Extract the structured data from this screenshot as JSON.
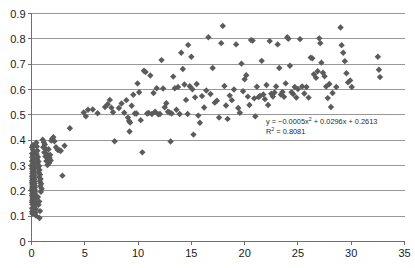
{
  "chart_data": {
    "type": "scatter",
    "title": "",
    "xlabel": "",
    "ylabel": "",
    "xlim": [
      0,
      35
    ],
    "ylim": [
      0,
      0.9
    ],
    "grid": true,
    "grid_axis": "y",
    "legend": false,
    "marker": {
      "shape": "diamond",
      "color": "#5b5b5b",
      "size": 3.2
    },
    "xticks": [
      "0",
      "5",
      "10",
      "15",
      "20",
      "25",
      "30",
      "35"
    ],
    "xtick_values": [
      0,
      5,
      10,
      15,
      20,
      25,
      30,
      35
    ],
    "yticks": [
      "0",
      "0.1",
      "0.2",
      "0.3",
      "0.4",
      "0.5",
      "0.6",
      "0.7",
      "0.8",
      "0.9"
    ],
    "ytick_values": [
      0,
      0.1,
      0.2,
      0.3,
      0.4,
      0.5,
      0.6,
      0.7,
      0.8,
      0.9
    ],
    "annotations": {
      "equation": "y = −0.0005x² + 0.0296x + 0.2613",
      "equation_parts": {
        "lead": "y = −0.0005x",
        "sup": "2",
        "tail": " + 0.0296x + 0.2613"
      },
      "r_squared": "R² = 0.8081",
      "r_squared_parts": {
        "lead": "R",
        "sup": "2",
        "tail": " = 0.8081"
      }
    },
    "fit": {
      "model": "quadratic",
      "a": -0.0005,
      "b": 0.0296,
      "c": 0.2613,
      "r2": 0.8081,
      "drawn": false
    },
    "points": [
      [
        0.05,
        0.372
      ],
      [
        0.06,
        0.347
      ],
      [
        0.07,
        0.333
      ],
      [
        0.05,
        0.318
      ],
      [
        0.08,
        0.305
      ],
      [
        0.06,
        0.296
      ],
      [
        0.05,
        0.287
      ],
      [
        0.09,
        0.276
      ],
      [
        0.07,
        0.268
      ],
      [
        0.05,
        0.258
      ],
      [
        0.08,
        0.249
      ],
      [
        0.06,
        0.241
      ],
      [
        0.05,
        0.232
      ],
      [
        0.09,
        0.224
      ],
      [
        0.07,
        0.215
      ],
      [
        0.05,
        0.206
      ],
      [
        0.08,
        0.198
      ],
      [
        0.06,
        0.189
      ],
      [
        0.05,
        0.181
      ],
      [
        0.1,
        0.172
      ],
      [
        0.07,
        0.163
      ],
      [
        0.05,
        0.155
      ],
      [
        0.09,
        0.146
      ],
      [
        0.06,
        0.131
      ],
      [
        0.05,
        0.118
      ],
      [
        0.08,
        0.11
      ],
      [
        0.12,
        0.38
      ],
      [
        0.14,
        0.362
      ],
      [
        0.16,
        0.352
      ],
      [
        0.13,
        0.341
      ],
      [
        0.18,
        0.33
      ],
      [
        0.15,
        0.322
      ],
      [
        0.2,
        0.312
      ],
      [
        0.17,
        0.303
      ],
      [
        0.22,
        0.294
      ],
      [
        0.19,
        0.286
      ],
      [
        0.24,
        0.278
      ],
      [
        0.21,
        0.27
      ],
      [
        0.26,
        0.262
      ],
      [
        0.23,
        0.254
      ],
      [
        0.28,
        0.246
      ],
      [
        0.25,
        0.238
      ],
      [
        0.3,
        0.229
      ],
      [
        0.27,
        0.221
      ],
      [
        0.32,
        0.213
      ],
      [
        0.29,
        0.204
      ],
      [
        0.34,
        0.196
      ],
      [
        0.31,
        0.188
      ],
      [
        0.36,
        0.18
      ],
      [
        0.33,
        0.168
      ],
      [
        0.38,
        0.155
      ],
      [
        0.35,
        0.143
      ],
      [
        0.4,
        0.128
      ],
      [
        0.37,
        0.113
      ],
      [
        0.42,
        0.102
      ],
      [
        0.45,
        0.39
      ],
      [
        0.5,
        0.375
      ],
      [
        0.55,
        0.358
      ],
      [
        0.48,
        0.345
      ],
      [
        0.6,
        0.334
      ],
      [
        0.52,
        0.325
      ],
      [
        0.65,
        0.316
      ],
      [
        0.58,
        0.306
      ],
      [
        0.7,
        0.298
      ],
      [
        0.62,
        0.29
      ],
      [
        0.75,
        0.282
      ],
      [
        0.68,
        0.272
      ],
      [
        0.8,
        0.264
      ],
      [
        0.72,
        0.255
      ],
      [
        0.85,
        0.247
      ],
      [
        0.78,
        0.238
      ],
      [
        0.9,
        0.228
      ],
      [
        0.82,
        0.219
      ],
      [
        0.95,
        0.208
      ],
      [
        0.88,
        0.196
      ],
      [
        0.6,
        0.176
      ],
      [
        0.72,
        0.158
      ],
      [
        0.66,
        0.145
      ],
      [
        0.8,
        0.12
      ],
      [
        0.75,
        0.093
      ],
      [
        1.05,
        0.402
      ],
      [
        1.15,
        0.392
      ],
      [
        1.25,
        0.383
      ],
      [
        1.1,
        0.372
      ],
      [
        1.35,
        0.365
      ],
      [
        1.2,
        0.352
      ],
      [
        1.45,
        0.345
      ],
      [
        1.3,
        0.336
      ],
      [
        1.55,
        0.328
      ],
      [
        1.4,
        0.318
      ],
      [
        1.65,
        0.31
      ],
      [
        1.5,
        0.302
      ],
      [
        1.75,
        0.342
      ],
      [
        1.6,
        0.364
      ],
      [
        1.85,
        0.398
      ],
      [
        1.95,
        0.406
      ],
      [
        2.05,
        0.412
      ],
      [
        2.15,
        0.396
      ],
      [
        1.7,
        0.33
      ],
      [
        1.8,
        0.32
      ],
      [
        2.3,
        0.372
      ],
      [
        2.45,
        0.362
      ],
      [
        2.6,
        0.36
      ],
      [
        2.75,
        0.358
      ],
      [
        2.9,
        0.26
      ],
      [
        3.1,
        0.378
      ],
      [
        3.6,
        0.447
      ],
      [
        4.9,
        0.509
      ],
      [
        5.1,
        0.494
      ],
      [
        5.3,
        0.52
      ],
      [
        5.75,
        0.521
      ],
      [
        6.2,
        0.506
      ],
      [
        6.9,
        0.531
      ],
      [
        7.15,
        0.542
      ],
      [
        7.35,
        0.559
      ],
      [
        7.5,
        0.528
      ],
      [
        7.65,
        0.51
      ],
      [
        7.8,
        0.396
      ],
      [
        8.2,
        0.527
      ],
      [
        8.45,
        0.545
      ],
      [
        8.7,
        0.508
      ],
      [
        8.9,
        0.558
      ],
      [
        9.05,
        0.489
      ],
      [
        9.15,
        0.476
      ],
      [
        9.25,
        0.47
      ],
      [
        9.2,
        0.434
      ],
      [
        9.4,
        0.536
      ],
      [
        9.55,
        0.579
      ],
      [
        9.7,
        0.505
      ],
      [
        9.85,
        0.505
      ],
      [
        9.95,
        0.624
      ],
      [
        10.1,
        0.589
      ],
      [
        10.25,
        0.479
      ],
      [
        10.4,
        0.352
      ],
      [
        10.55,
        0.674
      ],
      [
        10.7,
        0.669
      ],
      [
        10.85,
        0.505
      ],
      [
        11.0,
        0.507
      ],
      [
        11.15,
        0.655
      ],
      [
        11.3,
        0.503
      ],
      [
        11.45,
        0.586
      ],
      [
        11.6,
        0.512
      ],
      [
        11.75,
        0.605
      ],
      [
        11.9,
        0.502
      ],
      [
        12.05,
        0.503
      ],
      [
        12.2,
        0.716
      ],
      [
        12.35,
        0.604
      ],
      [
        12.5,
        0.53
      ],
      [
        12.65,
        0.546
      ],
      [
        12.8,
        0.512
      ],
      [
        12.95,
        0.509
      ],
      [
        13.05,
        0.395
      ],
      [
        13.15,
        0.505
      ],
      [
        13.3,
        0.651
      ],
      [
        13.45,
        0.605
      ],
      [
        13.6,
        0.52
      ],
      [
        13.75,
        0.61
      ],
      [
        13.9,
        0.503
      ],
      [
        14.05,
        0.745
      ],
      [
        14.2,
        0.681
      ],
      [
        14.35,
        0.62
      ],
      [
        14.5,
        0.559
      ],
      [
        14.65,
        0.503
      ],
      [
        14.7,
        0.776
      ],
      [
        14.85,
        0.613
      ],
      [
        15.0,
        0.729
      ],
      [
        15.1,
        0.601
      ],
      [
        15.2,
        0.422
      ],
      [
        15.35,
        0.569
      ],
      [
        15.5,
        0.622
      ],
      [
        15.65,
        0.497
      ],
      [
        15.8,
        0.469
      ],
      [
        16.0,
        0.574
      ],
      [
        16.2,
        0.529
      ],
      [
        16.4,
        0.596
      ],
      [
        16.6,
        0.806
      ],
      [
        16.8,
        0.582
      ],
      [
        17.0,
        0.685
      ],
      [
        17.2,
        0.548
      ],
      [
        17.4,
        0.556
      ],
      [
        17.6,
        0.489
      ],
      [
        17.8,
        0.783
      ],
      [
        17.95,
        0.851
      ],
      [
        18.1,
        0.614
      ],
      [
        18.25,
        0.537
      ],
      [
        18.4,
        0.484
      ],
      [
        18.6,
        0.576
      ],
      [
        18.8,
        0.558
      ],
      [
        19.0,
        0.6
      ],
      [
        19.2,
        0.778
      ],
      [
        19.4,
        0.527
      ],
      [
        19.55,
        0.508
      ],
      [
        19.7,
        0.702
      ],
      [
        19.85,
        0.593
      ],
      [
        20.0,
        0.64
      ],
      [
        20.15,
        0.656
      ],
      [
        20.3,
        0.572
      ],
      [
        20.45,
        0.539
      ],
      [
        20.6,
        0.795
      ],
      [
        20.75,
        0.793
      ],
      [
        20.9,
        0.565
      ],
      [
        21.0,
        0.494
      ],
      [
        21.15,
        0.611
      ],
      [
        21.3,
        0.57
      ],
      [
        21.45,
        0.575
      ],
      [
        21.6,
        0.713
      ],
      [
        21.75,
        0.58
      ],
      [
        21.9,
        0.562
      ],
      [
        22.05,
        0.618
      ],
      [
        22.2,
        0.539
      ],
      [
        22.35,
        0.791
      ],
      [
        22.5,
        0.583
      ],
      [
        22.65,
        0.572
      ],
      [
        22.8,
        0.588
      ],
      [
        22.95,
        0.612
      ],
      [
        23.1,
        0.778
      ],
      [
        23.25,
        0.685
      ],
      [
        23.4,
        0.58
      ],
      [
        23.55,
        0.59
      ],
      [
        23.7,
        0.571
      ],
      [
        23.85,
        0.624
      ],
      [
        24.0,
        0.806
      ],
      [
        24.1,
        0.8
      ],
      [
        24.25,
        0.694
      ],
      [
        24.4,
        0.589
      ],
      [
        24.55,
        0.582
      ],
      [
        24.7,
        0.61
      ],
      [
        24.85,
        0.568
      ],
      [
        25.0,
        0.602
      ],
      [
        25.2,
        0.799
      ],
      [
        25.4,
        0.612
      ],
      [
        25.6,
        0.584
      ],
      [
        25.8,
        0.61
      ],
      [
        26.0,
        0.568
      ],
      [
        26.2,
        0.726
      ],
      [
        26.35,
        0.723
      ],
      [
        26.5,
        0.66
      ],
      [
        26.7,
        0.646
      ],
      [
        26.85,
        0.672
      ],
      [
        27.0,
        0.802
      ],
      [
        27.1,
        0.783
      ],
      [
        27.2,
        0.706
      ],
      [
        27.35,
        0.666
      ],
      [
        27.5,
        0.652
      ],
      [
        27.65,
        0.612
      ],
      [
        27.8,
        0.566
      ],
      [
        27.95,
        0.622
      ],
      [
        28.1,
        0.531
      ],
      [
        28.25,
        0.586
      ],
      [
        28.6,
        0.61
      ],
      [
        29.0,
        0.845
      ],
      [
        29.1,
        0.775
      ],
      [
        29.25,
        0.745
      ],
      [
        29.4,
        0.712
      ],
      [
        29.55,
        0.664
      ],
      [
        29.7,
        0.628
      ],
      [
        29.9,
        0.636
      ],
      [
        30.05,
        0.61
      ],
      [
        32.5,
        0.729
      ],
      [
        32.6,
        0.678
      ],
      [
        32.7,
        0.649
      ]
    ]
  }
}
